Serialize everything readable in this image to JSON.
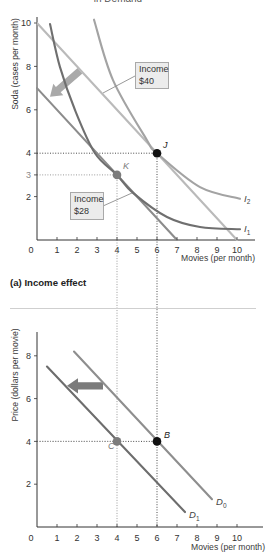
{
  "figure": {
    "top_title_partial": "in Demand",
    "panel_a_label": "(a) Income effect",
    "annotation_boxes": [
      {
        "line1": "Income",
        "line2": "$40"
      },
      {
        "line1": "Income",
        "line2": "$28"
      }
    ]
  },
  "colors": {
    "text": "#333333",
    "budget_40": "#bababa",
    "budget_28": "#8c8c8c",
    "I1": "#6f6f6f",
    "I2": "#a3a3a3",
    "D0": "#8e8e8e",
    "D1": "#6d6d6d",
    "point_dark": "#111111",
    "point_gray": "#7c7c7c",
    "arrow_top": "#a9a9a9",
    "arrow_bottom": "#7b7b7b",
    "separator": "#cfcfcf"
  },
  "chart_data": [
    {
      "type": "line",
      "title": "(a) Income effect",
      "xlabel": "Movies (per month)",
      "ylabel": "Soda (cases per month)",
      "xlim": [
        0,
        10.9
      ],
      "ylim": [
        0,
        10.3
      ],
      "grid": false,
      "x_ticks": [
        "0",
        "1",
        "2",
        "3",
        "4",
        "5",
        "6",
        "7",
        "8",
        "9",
        "10"
      ],
      "y_ticks": [
        {
          "value": 2,
          "label": "2"
        },
        {
          "value": 3,
          "label": "3",
          "color": "#8a8a8a"
        },
        {
          "value": 4,
          "label": "4"
        },
        {
          "value": 6,
          "label": "6"
        },
        {
          "value": 8,
          "label": "8"
        },
        {
          "value": 10,
          "label": "10"
        }
      ],
      "series": [
        {
          "name": "Budget line, income $40",
          "kind": "line",
          "color": "#bababa",
          "points": [
            [
              0,
              10
            ],
            [
              10,
              0
            ]
          ]
        },
        {
          "name": "Budget line, income $28",
          "kind": "line",
          "color": "#8c8c8c",
          "points": [
            [
              0,
              7
            ],
            [
              7,
              0
            ]
          ]
        },
        {
          "name": "I2",
          "label": "I",
          "subscript": "2",
          "kind": "curve",
          "color": "#a3a3a3",
          "points": [
            [
              2.85,
              10.15
            ],
            [
              3.8,
              7.37
            ],
            [
              5.5,
              4.6
            ],
            [
              6,
              4
            ],
            [
              8.15,
              2.44
            ],
            [
              10.15,
              1.9
            ]
          ]
        },
        {
          "name": "I1",
          "label": "I",
          "subscript": "1",
          "kind": "curve",
          "color": "#6f6f6f",
          "points": [
            [
              0.65,
              9.95
            ],
            [
              1.15,
              7.97
            ],
            [
              1.9,
              5.99
            ],
            [
              2.9,
              4.0
            ],
            [
              4,
              3
            ],
            [
              4.8,
              2.17
            ],
            [
              6.5,
              1.06
            ],
            [
              8.15,
              0.6
            ],
            [
              10.15,
              0.5
            ]
          ]
        }
      ],
      "points": [
        {
          "name": "J",
          "x": 6,
          "y": 4,
          "color": "#111111"
        },
        {
          "name": "K",
          "x": 4,
          "y": 3,
          "color": "#7c7c7c"
        }
      ],
      "arrows": [
        {
          "from": [
            2.15,
            7.8
          ],
          "to": [
            0.65,
            6.6
          ],
          "color": "#a9a9a9",
          "meaning": "budget line shifts leftward as income falls"
        }
      ],
      "annotations": [
        "Income $40",
        "Income $28"
      ]
    },
    {
      "type": "line",
      "title": "",
      "xlabel": "Movies (per month)",
      "ylabel": "Price (dollars per movie)",
      "xlim": [
        0,
        11.3
      ],
      "ylim": [
        0,
        9.1
      ],
      "grid": false,
      "x_ticks": [
        "0",
        "1",
        "2",
        "3",
        "4",
        "5",
        "6",
        "7",
        "8",
        "9",
        "10"
      ],
      "y_ticks": [
        {
          "value": 2,
          "label": "2"
        },
        {
          "value": 4,
          "label": "4"
        },
        {
          "value": 6,
          "label": "6"
        },
        {
          "value": 8,
          "label": "8"
        }
      ],
      "series": [
        {
          "name": "D0",
          "label": "D",
          "subscript": "0",
          "kind": "line",
          "color": "#8e8e8e",
          "points": [
            [
              1.85,
              8.2
            ],
            [
              8.75,
              1.3
            ]
          ]
        },
        {
          "name": "D1",
          "label": "D",
          "subscript": "1",
          "kind": "line",
          "color": "#6d6d6d",
          "points": [
            [
              0.5,
              7.5
            ],
            [
              7.4,
              0.7
            ]
          ]
        }
      ],
      "points": [
        {
          "name": "B",
          "x": 6,
          "y": 4,
          "color": "#111111"
        },
        {
          "name": "C",
          "x": 4,
          "y": 4,
          "color": "#7c7c7c"
        }
      ],
      "arrows": [
        {
          "from": [
            3.3,
            6.6
          ],
          "to": [
            1.5,
            6.6
          ],
          "color": "#7b7b7b",
          "meaning": "demand curve shifts leftward from D0 to D1"
        }
      ]
    }
  ]
}
